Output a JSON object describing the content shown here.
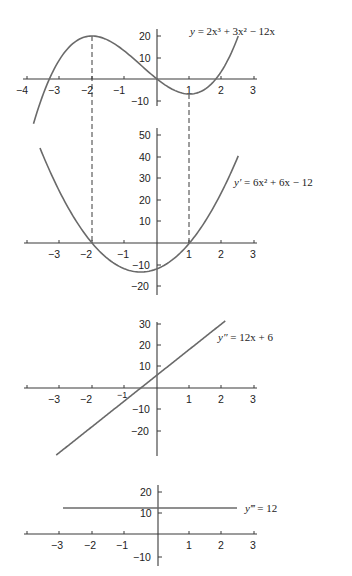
{
  "chart_data": [
    {
      "type": "line",
      "title": "y = 2x^3 + 3x^2 - 12x",
      "equation_label": "y = 2x³ + 3x² − 12x",
      "xlim": [
        -4,
        3
      ],
      "ylim": [
        -10,
        20
      ],
      "x_ticks": [
        "−4",
        "−3",
        "−2",
        "−1",
        "1",
        "2",
        "3"
      ],
      "y_ticks": [
        "20",
        "10",
        "−10"
      ],
      "critical_points": [
        {
          "x": -2,
          "y": 20
        },
        {
          "x": 1,
          "y": -7
        }
      ],
      "series": [
        {
          "name": "y",
          "function": "2x^3+3x^2-12x",
          "x_range": [
            -3.8,
            2.5
          ]
        }
      ]
    },
    {
      "type": "line",
      "title": "y' = 6x^2 + 6x - 12",
      "equation_label": "y′ = 6x² + 6x − 12",
      "xlim": [
        -4,
        3
      ],
      "ylim": [
        -20,
        50
      ],
      "x_ticks": [
        "−3",
        "−2",
        "−1",
        "1",
        "2",
        "3"
      ],
      "y_ticks": [
        "50",
        "40",
        "30",
        "20",
        "10",
        "−10",
        "−20"
      ],
      "roots": [
        -2,
        1
      ],
      "series": [
        {
          "name": "y'",
          "function": "6x^2+6x-12",
          "x_range": [
            -3.6,
            2.5
          ]
        }
      ]
    },
    {
      "type": "line",
      "title": "y'' = 12x + 6",
      "equation_label": "y″ = 12x + 6",
      "xlim": [
        -4,
        3
      ],
      "ylim": [
        -30,
        30
      ],
      "x_ticks": [
        "−3",
        "−2",
        "−1",
        "1",
        "2",
        "3"
      ],
      "y_ticks": [
        "30",
        "20",
        "10",
        "−10",
        "−20"
      ],
      "series": [
        {
          "name": "y''",
          "function": "12x+6",
          "x_range": [
            -3.1,
            2.1
          ]
        }
      ]
    },
    {
      "type": "line",
      "title": "y''' = 12",
      "equation_label": "y‴ = 12",
      "xlim": [
        -4,
        3
      ],
      "ylim": [
        -10,
        20
      ],
      "x_ticks": [
        "−3",
        "−2",
        "−1",
        "1",
        "2",
        "3"
      ],
      "y_ticks": [
        "20",
        "10",
        "−10"
      ],
      "series": [
        {
          "name": "y'''",
          "function": "12",
          "x_range": [
            -2.9,
            2.5
          ]
        }
      ]
    }
  ],
  "labels": {
    "g1": {
      "x_ticks": [
        "−4",
        "−3",
        "−2",
        "−1",
        "1",
        "2",
        "3"
      ],
      "y_ticks": [
        "20",
        "10",
        "−10"
      ],
      "eq": {
        "lhs": "y",
        "rhs": " = 2x³ + 3x² − 12x"
      }
    },
    "g2": {
      "x_ticks": [
        "−3",
        "−2",
        "−1",
        "1",
        "2",
        "3"
      ],
      "y_ticks": [
        "50",
        "40",
        "30",
        "20",
        "10",
        "−10",
        "−20"
      ],
      "eq": {
        "lhs": "y′",
        "rhs": " = 6x² + 6x − 12"
      }
    },
    "g3": {
      "x_ticks": [
        "−3",
        "−2",
        "−1",
        "1",
        "2",
        "3"
      ],
      "y_ticks": [
        "30",
        "20",
        "10",
        "−10",
        "−20"
      ],
      "eq": {
        "lhs": "y″",
        "rhs": " = 12x + 6"
      }
    },
    "g4": {
      "x_ticks": [
        "−3",
        "−2",
        "−1",
        "1",
        "2",
        "3"
      ],
      "y_ticks": [
        "20",
        "10",
        "−10"
      ],
      "eq": {
        "lhs": "y‴",
        "rhs": " = 12"
      }
    }
  }
}
